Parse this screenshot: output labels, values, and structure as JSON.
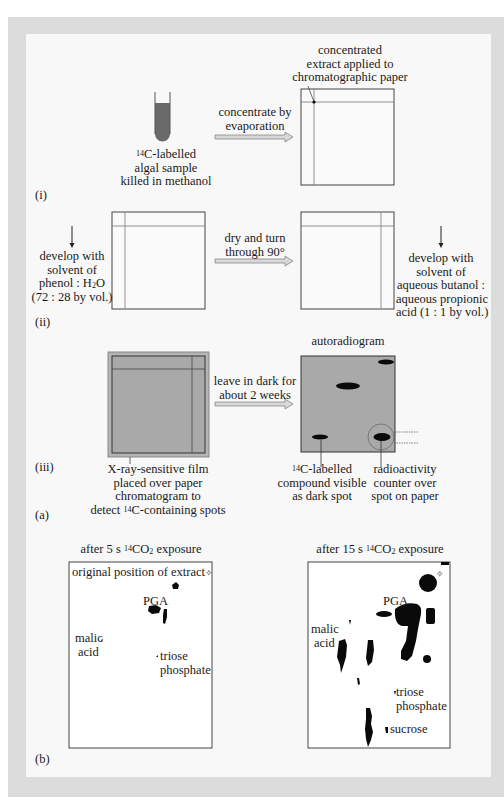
{
  "panel_a": {
    "step_i": {
      "label": "(i)",
      "test_tube_caption": [
        "C-labelled",
        "algal sample",
        "killed in methanol"
      ],
      "isotope_superscript": "14",
      "arrow_label": [
        "concentrate by",
        "evaporation"
      ],
      "paper_caption": [
        "concentrated",
        "extract applied to",
        "chromatographic paper"
      ]
    },
    "step_ii": {
      "label": "(ii)",
      "left_caption": [
        "develop with",
        "solvent of",
        "phenol : H",
        "O",
        "(72 : 28 by vol.)"
      ],
      "water_subscript": "2",
      "arrow_label": [
        "dry and turn",
        "through 90°"
      ],
      "right_caption": [
        "develop with",
        "solvent of",
        "aqueous butanol :",
        "aqueous propionic",
        "acid (1 : 1 by vol.)"
      ]
    },
    "step_iii": {
      "label": "(iii)",
      "autoradiogram_title": "autoradiogram",
      "arrow_label": [
        "leave in dark for",
        "about 2 weeks"
      ],
      "film_caption": [
        "X-ray-sensitive film",
        "placed over paper",
        "chromatogram to",
        "detect ",
        "C-containing spots"
      ],
      "spot_caption": [
        "C-labelled",
        "compound visible",
        "as dark spot"
      ],
      "counter_caption": [
        "radioactivity",
        "counter over",
        "spot on paper"
      ],
      "isotope_superscript": "14"
    },
    "label": "(a)"
  },
  "panel_b": {
    "label": "(b)",
    "left": {
      "title_pre": "after 5 s ",
      "title_sup": "14",
      "title_mid": "CO",
      "title_sub": "2",
      "title_post": " exposure",
      "origin_label": "original position of extract",
      "origin_marker": "✧",
      "spots": [
        "PGA",
        "malic",
        "acid",
        "triose",
        "phosphate"
      ]
    },
    "right": {
      "title_pre": "after 15 s ",
      "title_sup": "14",
      "title_mid": "CO",
      "title_sub": "2",
      "title_post": " exposure",
      "origin_marker": "✧",
      "spots": [
        "PGA",
        "malic",
        "acid",
        "triose",
        "phosphate",
        "sucrose"
      ]
    }
  },
  "colors": {
    "frame_outer": "#dcdcdc",
    "frame_inner": "#f8f8f8",
    "film_gray": "#a9a9a9",
    "tube_fill": "#6a6a6a",
    "spot_black": "#0a0a0a",
    "arrow_fill": "#d8d8d8"
  }
}
